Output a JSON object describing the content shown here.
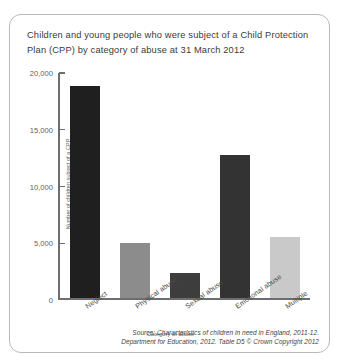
{
  "figure": {
    "title": "Children and young people who were subject of a Child Protection Plan (CPP) by category of abuse at 31 March 2012",
    "source_line_1": "Source: Characteristics of children in need in England, 2011-12.",
    "source_line_2": "Department for Education, 2012. Table D5 © Crown Copyright 2012"
  },
  "chart_data": {
    "type": "bar",
    "title": "Children and young people who were subject of a Child Protection Plan (CPP) by category of abuse at 31 March 2012",
    "categories": [
      "Neglect",
      "Physical abuse",
      "Sexual abuse",
      "Emotional abuse",
      "Multiple"
    ],
    "values": [
      18700,
      4900,
      2200,
      12600,
      5400
    ],
    "bar_colors": [
      "#201f1f",
      "#8c8c8c",
      "#3d3d3d",
      "#333333",
      "#c9c9c9"
    ],
    "xlabel": "Category of abuse",
    "ylabel": "Number of children subject of a CPP",
    "ylim": [
      0,
      20000
    ],
    "yticks": [
      0,
      5000,
      10000,
      15000,
      20000
    ],
    "ytick_labels": [
      "0",
      "5,000",
      "10,000",
      "15,000",
      "20,000"
    ],
    "grid": false,
    "legend": false
  }
}
